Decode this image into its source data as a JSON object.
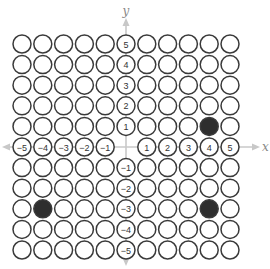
{
  "diagram": {
    "type": "coordinate-grid-dots",
    "x_axis_label": "x",
    "y_axis_label": "y",
    "range": {
      "min": -5,
      "max": 5
    },
    "x_tick_labels": [
      "-5",
      "-4",
      "-3",
      "-2",
      "-1",
      "1",
      "2",
      "3",
      "4",
      "5"
    ],
    "y_tick_labels": [
      "5",
      "4",
      "3",
      "2",
      "1",
      "-1",
      "-2",
      "-3",
      "-4",
      "-5"
    ],
    "filled_points": [
      {
        "x": 4,
        "y": 1
      },
      {
        "x": 4,
        "y": -3
      },
      {
        "x": -4,
        "y": -3
      }
    ],
    "colors": {
      "circle_stroke": "#3a3a3a",
      "filled": "#2e2e2e",
      "axis": "#c8c8c8",
      "label": "#333333",
      "axis_label": "#888888"
    }
  }
}
